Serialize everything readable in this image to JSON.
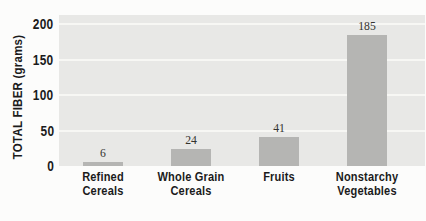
{
  "chart_data": {
    "type": "bar",
    "title": "",
    "categories": [
      "Refined\nCereals",
      "Whole Grain\nCereals",
      "Fruits",
      "Nonstarchy\nVegetables"
    ],
    "values": [
      6,
      24,
      41,
      185
    ],
    "value_labels": [
      "6",
      "24",
      "41",
      "185"
    ],
    "xlabel": "",
    "ylabel": "TOTAL FIBER (grams)",
    "yticks": [
      0,
      50,
      100,
      150,
      200
    ],
    "ylim": [
      0,
      212
    ],
    "grid": "horizontal",
    "legend": "none",
    "colors": {
      "page_background": "#fcfcfb",
      "plot_background": "#e8e8e6",
      "bar_fill": "#b5b5b3",
      "gridline": "#f7f7f4",
      "label_text": "#1b1b1b",
      "value_text": "#33332f"
    }
  }
}
